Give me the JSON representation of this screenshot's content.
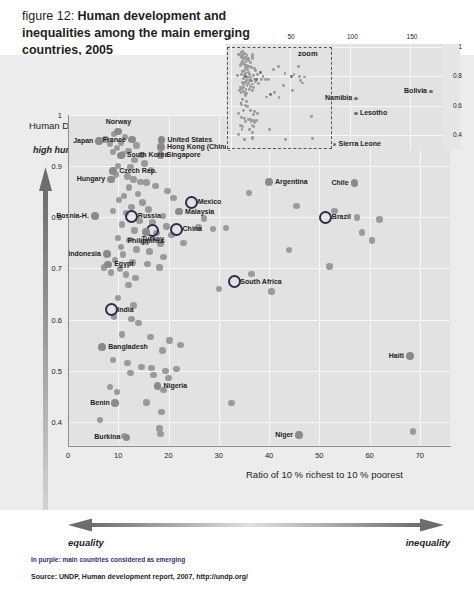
{
  "title": {
    "prefix": "figure 12: ",
    "main": "Human development and inequalities among the main emerging countries, 2005"
  },
  "credit": "Sciences Po / CERI et Atelier de cartographie, February 2008",
  "footer": {
    "equality_label": "equality",
    "inequality_label": "inequality",
    "purple_note": "In purple: main countries considered as emerging",
    "source": "Source: UNDP, Human development report, 2007, http://undp.org/"
  },
  "inset": {
    "zoom_label": "zoom",
    "xticks": [
      "0",
      "50",
      "100",
      "150"
    ],
    "yticks": [
      "1",
      "0.8",
      "0.6",
      "0.4"
    ],
    "labels": [
      {
        "name": "Namibia",
        "x": 105,
        "y": 0.65
      },
      {
        "name": "Bolivia",
        "x": 168,
        "y": 0.7
      },
      {
        "name": "Lesotho",
        "x": 105,
        "y": 0.55
      },
      {
        "name": "Sierra Leone",
        "x": 87,
        "y": 0.34
      }
    ]
  },
  "chart_data": {
    "type": "scatter",
    "title": "Human development and inequalities among the main emerging countries, 2005",
    "xlabel": "Ratio of 10 % richest to 10 % poorest",
    "ylabel": "Human Development Index (HDI)",
    "ylabel_note": "high human development",
    "xlim": [
      0,
      76
    ],
    "ylim": [
      0.355,
      1.0
    ],
    "xticks": [
      0,
      10,
      20,
      30,
      40,
      50,
      60,
      70
    ],
    "yticks": [
      0.4,
      0.5,
      0.6,
      0.7,
      0.8,
      0.9,
      1
    ],
    "grid": true,
    "legend": "In purple: main countries considered as emerging",
    "emerging_color": "#2f2b4a",
    "point_color": "#9a9a9a",
    "labeled_points": [
      {
        "name": "Norway",
        "x": 10.0,
        "y": 0.968,
        "emerging": false,
        "pos": "above"
      },
      {
        "name": "Japan",
        "x": 6.2,
        "y": 0.949,
        "emerging": false,
        "pos": "left"
      },
      {
        "name": "France",
        "x": 12.7,
        "y": 0.952,
        "emerging": false,
        "pos": "left"
      },
      {
        "name": "United States",
        "x": 18.6,
        "y": 0.951,
        "emerging": false,
        "pos": "right"
      },
      {
        "name": "Hong Kong (China)",
        "x": 18.5,
        "y": 0.937,
        "emerging": false,
        "pos": "right"
      },
      {
        "name": "Singapore",
        "x": 18.4,
        "y": 0.922,
        "emerging": false,
        "pos": "right"
      },
      {
        "name": "South Korea",
        "x": 10.5,
        "y": 0.921,
        "emerging": false,
        "pos": "right"
      },
      {
        "name": "Czech Rep.",
        "x": 9.0,
        "y": 0.891,
        "emerging": false,
        "pos": "right"
      },
      {
        "name": "Hungary",
        "x": 8.5,
        "y": 0.874,
        "emerging": false,
        "pos": "left"
      },
      {
        "name": "Chile",
        "x": 57.0,
        "y": 0.867,
        "emerging": false,
        "pos": "left"
      },
      {
        "name": "Argentina",
        "x": 40.0,
        "y": 0.869,
        "emerging": false,
        "pos": "right"
      },
      {
        "name": "Mexico",
        "x": 24.6,
        "y": 0.829,
        "emerging": true,
        "pos": "right"
      },
      {
        "name": "Malaysia",
        "x": 22.1,
        "y": 0.811,
        "emerging": false,
        "pos": "right"
      },
      {
        "name": "Russia",
        "x": 12.7,
        "y": 0.802,
        "emerging": true,
        "pos": "right"
      },
      {
        "name": "Bosnia-H.",
        "x": 5.4,
        "y": 0.803,
        "emerging": false,
        "pos": "left"
      },
      {
        "name": "China",
        "x": 21.6,
        "y": 0.777,
        "emerging": true,
        "pos": "right"
      },
      {
        "name": "Turkey",
        "x": 16.8,
        "y": 0.775,
        "emerging": true,
        "pos": "below"
      },
      {
        "name": "Brazil",
        "x": 51.3,
        "y": 0.8,
        "emerging": true,
        "pos": "right"
      },
      {
        "name": "Philippines",
        "x": 15.5,
        "y": 0.771,
        "emerging": false,
        "pos": "below"
      },
      {
        "name": "Indonesia",
        "x": 7.8,
        "y": 0.728,
        "emerging": false,
        "pos": "left"
      },
      {
        "name": "Egypt",
        "x": 8.0,
        "y": 0.708,
        "emerging": false,
        "pos": "right"
      },
      {
        "name": "South Africa",
        "x": 33.1,
        "y": 0.674,
        "emerging": true,
        "pos": "right"
      },
      {
        "name": "India",
        "x": 8.6,
        "y": 0.619,
        "emerging": true,
        "pos": "right"
      },
      {
        "name": "Bangladesh",
        "x": 6.8,
        "y": 0.547,
        "emerging": false,
        "pos": "right"
      },
      {
        "name": "Nigeria",
        "x": 17.8,
        "y": 0.47,
        "emerging": false,
        "pos": "right"
      },
      {
        "name": "Haiti",
        "x": 68.0,
        "y": 0.529,
        "emerging": false,
        "pos": "left"
      },
      {
        "name": "Benin",
        "x": 9.4,
        "y": 0.437,
        "emerging": false,
        "pos": "left"
      },
      {
        "name": "Burkina",
        "x": 11.6,
        "y": 0.37,
        "emerging": false,
        "pos": "left"
      },
      {
        "name": "Niger",
        "x": 46.0,
        "y": 0.374,
        "emerging": false,
        "pos": "left"
      }
    ],
    "unlabeled_points": [
      {
        "x": 9.2,
        "y": 0.963
      },
      {
        "x": 11.4,
        "y": 0.957
      },
      {
        "x": 7.5,
        "y": 0.952
      },
      {
        "x": 8.3,
        "y": 0.944
      },
      {
        "x": 10.6,
        "y": 0.946
      },
      {
        "x": 13.6,
        "y": 0.94
      },
      {
        "x": 9.8,
        "y": 0.936
      },
      {
        "x": 12.0,
        "y": 0.93
      },
      {
        "x": 8.9,
        "y": 0.928
      },
      {
        "x": 11.0,
        "y": 0.924
      },
      {
        "x": 14.6,
        "y": 0.922
      },
      {
        "x": 13.2,
        "y": 0.912
      },
      {
        "x": 15.2,
        "y": 0.905
      },
      {
        "x": 10.0,
        "y": 0.9
      },
      {
        "x": 12.4,
        "y": 0.898
      },
      {
        "x": 16.5,
        "y": 0.893
      },
      {
        "x": 9.6,
        "y": 0.884
      },
      {
        "x": 11.8,
        "y": 0.88
      },
      {
        "x": 13.0,
        "y": 0.874
      },
      {
        "x": 14.4,
        "y": 0.869
      },
      {
        "x": 15.6,
        "y": 0.868
      },
      {
        "x": 17.4,
        "y": 0.861
      },
      {
        "x": 12.1,
        "y": 0.858
      },
      {
        "x": 19.8,
        "y": 0.851
      },
      {
        "x": 13.9,
        "y": 0.845
      },
      {
        "x": 11.2,
        "y": 0.842
      },
      {
        "x": 21.0,
        "y": 0.838
      },
      {
        "x": 10.2,
        "y": 0.834
      },
      {
        "x": 14.8,
        "y": 0.829
      },
      {
        "x": 36.0,
        "y": 0.847
      },
      {
        "x": 45.5,
        "y": 0.822
      },
      {
        "x": 12.6,
        "y": 0.82
      },
      {
        "x": 16.0,
        "y": 0.815
      },
      {
        "x": 9.0,
        "y": 0.812
      },
      {
        "x": 11.5,
        "y": 0.808
      },
      {
        "x": 18.9,
        "y": 0.803
      },
      {
        "x": 27.0,
        "y": 0.798
      },
      {
        "x": 53.0,
        "y": 0.812
      },
      {
        "x": 57.5,
        "y": 0.8
      },
      {
        "x": 62.0,
        "y": 0.796
      },
      {
        "x": 14.2,
        "y": 0.793
      },
      {
        "x": 16.8,
        "y": 0.79
      },
      {
        "x": 10.8,
        "y": 0.786
      },
      {
        "x": 19.6,
        "y": 0.782
      },
      {
        "x": 26.0,
        "y": 0.78
      },
      {
        "x": 28.8,
        "y": 0.777
      },
      {
        "x": 31.4,
        "y": 0.779
      },
      {
        "x": 13.2,
        "y": 0.774
      },
      {
        "x": 17.6,
        "y": 0.769
      },
      {
        "x": 20.6,
        "y": 0.765
      },
      {
        "x": 9.9,
        "y": 0.76
      },
      {
        "x": 12.2,
        "y": 0.756
      },
      {
        "x": 15.0,
        "y": 0.752
      },
      {
        "x": 18.4,
        "y": 0.748
      },
      {
        "x": 23.0,
        "y": 0.75
      },
      {
        "x": 58.5,
        "y": 0.77
      },
      {
        "x": 60.5,
        "y": 0.755
      },
      {
        "x": 10.6,
        "y": 0.742
      },
      {
        "x": 13.6,
        "y": 0.737
      },
      {
        "x": 16.2,
        "y": 0.733
      },
      {
        "x": 11.0,
        "y": 0.727
      },
      {
        "x": 19.0,
        "y": 0.722
      },
      {
        "x": 44.0,
        "y": 0.736
      },
      {
        "x": 9.4,
        "y": 0.716
      },
      {
        "x": 12.8,
        "y": 0.712
      },
      {
        "x": 15.8,
        "y": 0.709
      },
      {
        "x": 7.2,
        "y": 0.702
      },
      {
        "x": 10.4,
        "y": 0.699
      },
      {
        "x": 18.2,
        "y": 0.702
      },
      {
        "x": 52.0,
        "y": 0.704
      },
      {
        "x": 8.6,
        "y": 0.692
      },
      {
        "x": 11.6,
        "y": 0.688
      },
      {
        "x": 13.4,
        "y": 0.681
      },
      {
        "x": 36.5,
        "y": 0.689
      },
      {
        "x": 12.0,
        "y": 0.668
      },
      {
        "x": 30.0,
        "y": 0.66
      },
      {
        "x": 40.5,
        "y": 0.655
      },
      {
        "x": 10.0,
        "y": 0.642
      },
      {
        "x": 13.0,
        "y": 0.628
      },
      {
        "x": 9.2,
        "y": 0.606
      },
      {
        "x": 12.6,
        "y": 0.601
      },
      {
        "x": 14.0,
        "y": 0.593
      },
      {
        "x": 10.8,
        "y": 0.571
      },
      {
        "x": 16.4,
        "y": 0.566
      },
      {
        "x": 20.2,
        "y": 0.559
      },
      {
        "x": 22.4,
        "y": 0.55
      },
      {
        "x": 18.8,
        "y": 0.54
      },
      {
        "x": 9.0,
        "y": 0.521
      },
      {
        "x": 11.8,
        "y": 0.515
      },
      {
        "x": 14.6,
        "y": 0.508
      },
      {
        "x": 16.6,
        "y": 0.505
      },
      {
        "x": 19.4,
        "y": 0.5
      },
      {
        "x": 21.6,
        "y": 0.503
      },
      {
        "x": 12.4,
        "y": 0.496
      },
      {
        "x": 17.0,
        "y": 0.492
      },
      {
        "x": 20.0,
        "y": 0.486
      },
      {
        "x": 8.4,
        "y": 0.468
      },
      {
        "x": 9.8,
        "y": 0.459
      },
      {
        "x": 19.0,
        "y": 0.462
      },
      {
        "x": 32.5,
        "y": 0.437
      },
      {
        "x": 15.6,
        "y": 0.438
      },
      {
        "x": 18.6,
        "y": 0.419
      },
      {
        "x": 6.4,
        "y": 0.404
      },
      {
        "x": 18.2,
        "y": 0.387
      },
      {
        "x": 18.4,
        "y": 0.377
      },
      {
        "x": 11.2,
        "y": 0.372
      },
      {
        "x": 68.6,
        "y": 0.381
      }
    ]
  }
}
